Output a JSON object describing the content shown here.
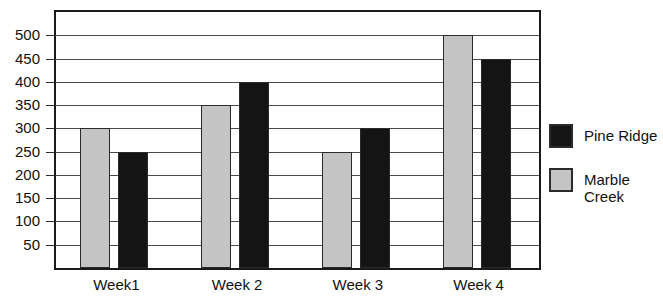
{
  "chart_data": {
    "type": "bar",
    "title": "",
    "subtitle": "",
    "xlabel": "",
    "ylabel": "",
    "categories": [
      "Week1",
      "Week 2",
      "Week 3",
      "Week 4"
    ],
    "series": [
      {
        "name": "Marble\nCreek",
        "legend_label": "Marble\nCreek",
        "color": "#c4c4c4",
        "values": [
          300,
          350,
          250,
          500
        ]
      },
      {
        "name": "Pine Ridge",
        "legend_label": "Pine Ridge",
        "color": "#141414",
        "values": [
          250,
          400,
          300,
          450
        ]
      }
    ],
    "ylim": [
      0,
      550
    ],
    "yticks": [
      50,
      100,
      150,
      200,
      250,
      300,
      350,
      400,
      450,
      500
    ],
    "ytick_labels": [
      "50",
      "100",
      "150",
      "200",
      "250",
      "300",
      "350",
      "400",
      "450",
      "500"
    ],
    "grid": true,
    "grid_axis": "y",
    "legend_position": "right"
  },
  "legend": {
    "items": [
      {
        "label": "Pine Ridge",
        "color": "#141414"
      },
      {
        "label": "Marble\nCreek",
        "color": "#c4c4c4"
      }
    ]
  },
  "colors": {
    "pine_ridge": "#141414",
    "marble_creek": "#c4c4c4",
    "axis": "#1a1a1a",
    "gridline": "#4a4a4a",
    "background": "#ffffff",
    "text": "#111111"
  }
}
